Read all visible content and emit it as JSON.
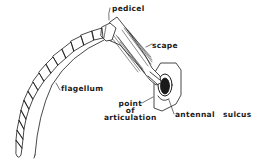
{
  "diagram": {
    "labels": {
      "pedicel": "pedicel",
      "scape": "scape",
      "flagellum": "flagellum",
      "point_of_articulation": [
        "point",
        "of",
        "articulation"
      ],
      "antennal": "antennal",
      "sulcus": "sulcus"
    },
    "colors": {
      "ink": "#1a1a1a",
      "background": "#ffffff"
    }
  }
}
